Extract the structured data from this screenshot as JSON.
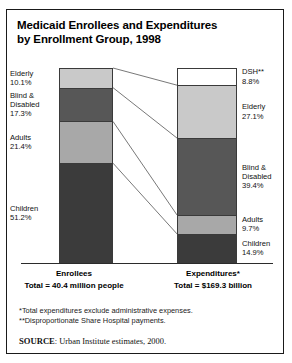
{
  "title": {
    "line1": "Medicaid Enrollees and Expenditures",
    "line2": "by Enrollment Group, 1998"
  },
  "axis": {
    "left_label": "Enrollees",
    "left_total": "Total = 40.4 million people",
    "right_label": "Expenditures*",
    "right_total": "Total = $169.3 billion"
  },
  "notes": {
    "note1": "*Total expenditures exclude administrative expenses.",
    "note2": "**Disproportionate Share Hospital payments."
  },
  "source": {
    "prefix": "SOURCE",
    "text": ": Urban Institute estimates, 2000."
  },
  "colors": {
    "elderly": "#c9c9c9",
    "blind_disabled": "#575757",
    "adults": "#a8a8a8",
    "children": "#3b3b3b",
    "dsh": "#ffffff",
    "outline": "#3a3a3a"
  },
  "chart_data": {
    "type": "bar",
    "title": "Medicaid Enrollees and Expenditures by Enrollment Group, 1998",
    "xlabel": "",
    "ylabel": "Percent of total",
    "ylim": [
      0,
      100
    ],
    "grid": false,
    "legend": "inline-labels",
    "categories": [
      "Enrollees",
      "Expenditures*"
    ],
    "series": [
      {
        "name": "DSH**",
        "values": [
          0.0,
          8.8
        ]
      },
      {
        "name": "Elderly",
        "values": [
          10.1,
          27.1
        ]
      },
      {
        "name": "Blind & Disabled",
        "values": [
          17.3,
          39.4
        ]
      },
      {
        "name": "Adults",
        "values": [
          21.4,
          9.7
        ]
      },
      {
        "name": "Children",
        "values": [
          51.2,
          14.9
        ]
      }
    ],
    "totals": {
      "enrollees": "40.4 million people",
      "expenditures": "$169.3 billion"
    }
  },
  "bars": {
    "enrollees": [
      {
        "name": "Elderly",
        "label": "Elderly",
        "label2": "",
        "pct": "10.1%",
        "value": 10.1,
        "color": "#c9c9c9"
      },
      {
        "name": "Blind & Disabled",
        "label": "Blind &",
        "label2": "Disabled",
        "pct": "17.3%",
        "value": 17.3,
        "color": "#575757"
      },
      {
        "name": "Adults",
        "label": "Adults",
        "label2": "",
        "pct": "21.4%",
        "value": 21.4,
        "color": "#a8a8a8"
      },
      {
        "name": "Children",
        "label": "Children",
        "label2": "",
        "pct": "51.2%",
        "value": 51.2,
        "color": "#3b3b3b"
      }
    ],
    "expenditures": [
      {
        "name": "DSH**",
        "label": "DSH**",
        "label2": "",
        "pct": "8.8%",
        "value": 8.8,
        "color": "#ffffff"
      },
      {
        "name": "Elderly",
        "label": "Elderly",
        "label2": "",
        "pct": "27.1%",
        "value": 27.1,
        "color": "#c9c9c9"
      },
      {
        "name": "Blind & Disabled",
        "label": "Blind &",
        "label2": "Disabled",
        "pct": "39.4%",
        "value": 39.4,
        "color": "#575757"
      },
      {
        "name": "Adults",
        "label": "Adults",
        "label2": "",
        "pct": "9.7%",
        "value": 9.7,
        "color": "#a8a8a8"
      },
      {
        "name": "Children",
        "label": "Children",
        "label2": "",
        "pct": "14.9%",
        "value": 14.9,
        "color": "#3b3b3b"
      }
    ]
  }
}
